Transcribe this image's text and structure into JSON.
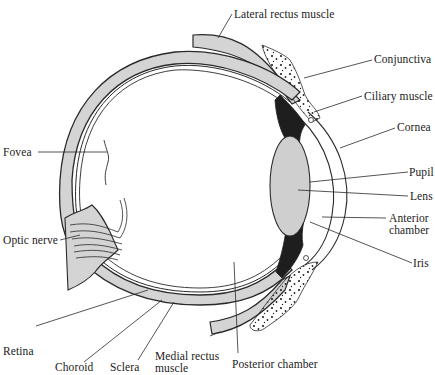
{
  "diagram": {
    "colors": {
      "outline": "#2a2a2a",
      "tissue_fill": "#d4d4d4",
      "pigment": "#1e1e1e",
      "lens_fill": "#cfcfcf",
      "background": "#ffffff"
    },
    "labels": {
      "lateral_rectus": "Lateral rectus muscle",
      "conjunctiva": "Conjunctiva",
      "ciliary_muscle": "Ciliary muscle",
      "cornea": "Cornea",
      "pupil": "Pupil",
      "lens": "Lens",
      "anterior_chamber_1": "Anterior",
      "anterior_chamber_2": "chamber",
      "iris": "Iris",
      "fovea": "Fovea",
      "optic_nerve": "Optic nerve",
      "retina": "Retina",
      "choroid": "Choroid",
      "sclera": "Sclera",
      "medial_rectus_1": "Medial  rectus",
      "medial_rectus_2": "muscle",
      "posterior_chamber": "Posterior chamber"
    }
  }
}
